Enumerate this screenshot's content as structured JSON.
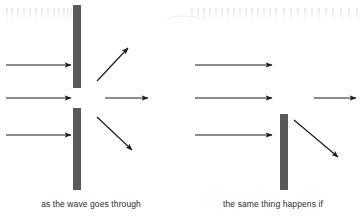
{
  "figure": {
    "width": 364,
    "height": 216,
    "background_color": "#ffffff",
    "barrier_color": "#595959",
    "wavefront_color": "#b9b9b9",
    "arrow_color": "#1a1a1a"
  },
  "panels": [
    {
      "id": "left-panel",
      "name": "single-slit-diffraction",
      "caption": "as the wave goes through",
      "barrier": {
        "x": 73,
        "width": 8,
        "segments": [
          {
            "top": 5,
            "bottom": 88
          },
          {
            "top": 108,
            "bottom": 190
          }
        ],
        "slit": {
          "top": 88,
          "bottom": 108
        }
      },
      "incoming_wavefronts": {
        "type": "plane",
        "count": 13,
        "x_start": 6,
        "x_end": 72,
        "y_top": 8,
        "y_bottom": 188
      },
      "outgoing_wavefronts": {
        "type": "circular",
        "count": 9,
        "origin_x": 80,
        "origin_y": 98,
        "radius_min": 10,
        "radius_max": 82,
        "angle_span_deg": 150
      },
      "arrows": [
        {
          "name": "incoming-arrow-top",
          "x1": 6,
          "y1": 65,
          "x2": 71,
          "y2": 65
        },
        {
          "name": "incoming-arrow-middle",
          "x1": 6,
          "y1": 98,
          "x2": 71,
          "y2": 98
        },
        {
          "name": "incoming-arrow-bottom",
          "x1": 6,
          "y1": 135,
          "x2": 71,
          "y2": 135
        },
        {
          "name": "outgoing-arrow-up",
          "x1": 97,
          "y1": 80,
          "x2": 128,
          "y2": 48
        },
        {
          "name": "outgoing-arrow-right",
          "x1": 105,
          "y1": 98,
          "x2": 148,
          "y2": 98
        },
        {
          "name": "outgoing-arrow-down",
          "x1": 97,
          "y1": 118,
          "x2": 132,
          "y2": 150
        }
      ]
    },
    {
      "id": "right-panel",
      "name": "edge-diffraction",
      "caption": "the same thing happens if",
      "barrier": {
        "x": 280,
        "width": 8,
        "segments": [
          {
            "top": 114,
            "bottom": 190
          }
        ],
        "slit": null
      },
      "incoming_wavefronts": {
        "type": "plane",
        "count": 13,
        "x_start": 190,
        "x_end": 279,
        "y_top": 8,
        "y_bottom": 188
      },
      "outgoing_wavefronts": {
        "type": "bending-around-edge",
        "count": 9,
        "edge_x": 284,
        "edge_y": 114,
        "x_end": 358,
        "y_top": 8
      },
      "arrows": [
        {
          "name": "incoming-arrow-top",
          "x1": 195,
          "y1": 65,
          "x2": 272,
          "y2": 65
        },
        {
          "name": "incoming-arrow-middle",
          "x1": 195,
          "y1": 98,
          "x2": 272,
          "y2": 98
        },
        {
          "name": "incoming-arrow-bottom",
          "x1": 195,
          "y1": 135,
          "x2": 272,
          "y2": 135
        },
        {
          "name": "outgoing-arrow-right",
          "x1": 314,
          "y1": 98,
          "x2": 356,
          "y2": 98
        },
        {
          "name": "outgoing-arrow-down",
          "x1": 294,
          "y1": 120,
          "x2": 340,
          "y2": 158
        }
      ]
    }
  ]
}
